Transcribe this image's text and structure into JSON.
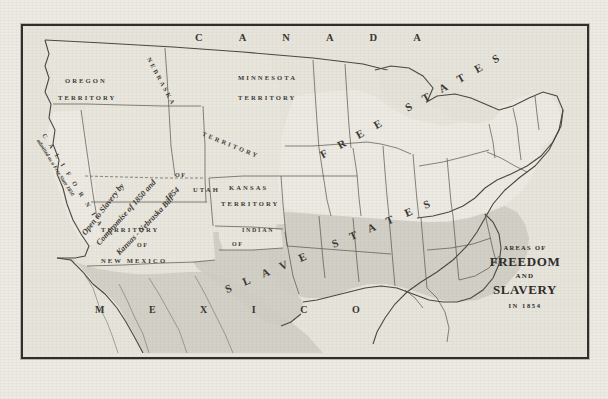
{
  "document": {
    "kind": "historical-map",
    "title_block": {
      "line1": "AREAS OF",
      "line2": "FREEDOM",
      "line3": "AND",
      "line4": "SLAVERY",
      "line5": "IN 1854"
    }
  },
  "colors": {
    "paper": "#edeae3",
    "plate_fill": "#e7e4dc",
    "frame": "#2f2d2a",
    "ink": "#3a3833",
    "free_fill": "#ece9e1",
    "slave_fill": "#cfccc4",
    "territory_fill": "#e9e6de",
    "water": "#e4e1d9"
  },
  "neighbors": [
    {
      "name": "canada",
      "label": "C A N A D A"
    },
    {
      "name": "mexico",
      "label": "M E X I C O"
    }
  ],
  "region_bands": [
    {
      "name": "free-states-band",
      "label": "FREE STATES"
    },
    {
      "name": "slave-states-band",
      "label": "SLAVE STATES"
    }
  ],
  "territories": [
    {
      "name": "oregon-territory",
      "line1": "OREGON",
      "line2": "TERRITORY"
    },
    {
      "name": "minnesota-territory",
      "line1": "MINNESOTA",
      "line2": "TERRITORY"
    },
    {
      "name": "nebraska-territory",
      "line1": "NEBRASKA",
      "line2": "TERRITORY"
    },
    {
      "name": "kansas-territory",
      "line1": "KANSAS",
      "line2": "TERRITORY"
    },
    {
      "name": "indian-territory",
      "line1": "INDIAN",
      "line2": "TERRITORY"
    },
    {
      "name": "utah-territory",
      "line1": "TERRITORY",
      "line2": "OF",
      "line3": "UTAH"
    },
    {
      "name": "new-mexico-territory",
      "line1": "TERRITORY",
      "line2": "OF",
      "line3": "NEW MEXICO"
    }
  ],
  "states": [
    {
      "name": "california",
      "label": "C A L I F O R N I A",
      "sublabel": "admitted as a Free State 1850"
    }
  ],
  "annotations": [
    {
      "name": "open-to-slavery-note",
      "text": "Open to Slavery by"
    },
    {
      "name": "compromise-1850-note",
      "text": "Compromise of 1850 and"
    },
    {
      "name": "kansas-nebraska-note",
      "text": "Kansas - Nebraska Bill"
    },
    {
      "name": "year-note",
      "text": "1854"
    }
  ]
}
